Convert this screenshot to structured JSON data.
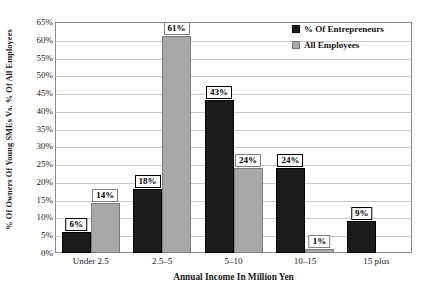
{
  "chart_data": {
    "type": "bar",
    "title": "",
    "xlabel": "Annual Income In Million Yen",
    "ylabel": "% Of Owners Of Young SMEs Vs. % Of All Employees",
    "categories": [
      "Under 2.5",
      "2.5–5",
      "5–10",
      "10–15",
      "15 plus"
    ],
    "series": [
      {
        "name": "% Of Entrepreneurs",
        "color": "#1b1b1b",
        "values": [
          6,
          18,
          43,
          24,
          9
        ],
        "labels": [
          "6%",
          "18%",
          "43%",
          "24%",
          "9%"
        ]
      },
      {
        "name": "All Employees",
        "color": "#a8a8a8",
        "values": [
          14,
          61,
          24,
          1,
          0
        ],
        "labels": [
          "14%",
          "61%",
          "24%",
          "1%",
          ""
        ]
      }
    ],
    "ylim": [
      0,
      65
    ],
    "ytick_step": 5,
    "ytick_labels": [
      "65%",
      "60%",
      "55%",
      "50%",
      "45%",
      "40%",
      "35%",
      "30%",
      "25%",
      "20%",
      "15%",
      "10%",
      "5%",
      "0%"
    ],
    "grid": true,
    "legend_position": "top-right"
  },
  "legend": {
    "items": [
      {
        "label": "% Of Entrepreneurs",
        "swatch": "black-square-icon"
      },
      {
        "label": "All Employees",
        "swatch": "gray-square-icon"
      }
    ]
  }
}
